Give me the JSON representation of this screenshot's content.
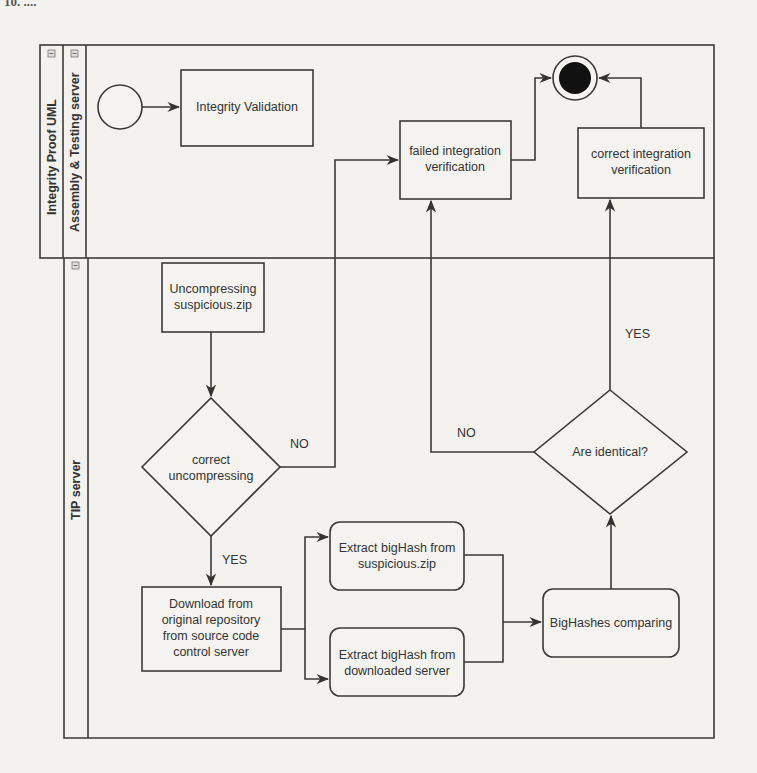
{
  "page": {
    "header_fragment": "10. ...."
  },
  "diagram": {
    "title": "Integrity Proof UML",
    "lanes": [
      {
        "id": "assembly",
        "label": "Assembly & Testing server"
      },
      {
        "id": "tip",
        "label": "TIP server"
      }
    ],
    "lane_toggle_icon": "⊟",
    "nodes": {
      "start": {
        "type": "initial"
      },
      "integrity_validation": {
        "label": "Integrity Validation"
      },
      "failed_verification": {
        "label_line1": "failed integration",
        "label_line2": "verification"
      },
      "correct_verification": {
        "label_line1": "correct integration",
        "label_line2": "verification"
      },
      "end": {
        "type": "final"
      },
      "uncompressing": {
        "label_line1": "Uncompressing",
        "label_line2": "suspicious.zip"
      },
      "decision_uncompress": {
        "label_line1": "correct",
        "label_line2": "uncompressing"
      },
      "download": {
        "label_line1": "Download from",
        "label_line2": "original repository",
        "label_line3": "from source code",
        "label_line4": "control server"
      },
      "extract_suspicious": {
        "label_line1": "Extract bigHash from",
        "label_line2": "suspicious.zip"
      },
      "extract_downloaded": {
        "label_line1": "Extract bigHash from",
        "label_line2": "downloaded server"
      },
      "bighashes_comparing": {
        "label": "BigHashes comparing"
      },
      "decision_identical": {
        "label": "Are identical?"
      }
    },
    "edge_labels": {
      "uncompress_no": "NO",
      "uncompress_yes": "YES",
      "identical_no": "NO",
      "identical_yes": "YES"
    }
  }
}
